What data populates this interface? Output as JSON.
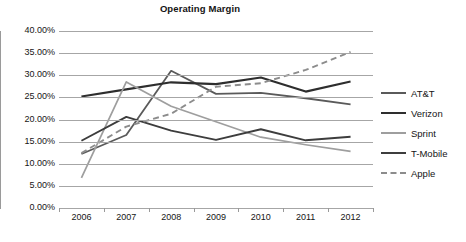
{
  "chart_data": {
    "type": "line",
    "title": "Operating Margin",
    "xlabel": "",
    "ylabel": "",
    "categories": [
      "2006",
      "2007",
      "2008",
      "2009",
      "2010",
      "2011",
      "2012"
    ],
    "x": [
      2006,
      2007,
      2008,
      2009,
      2010,
      2011,
      2012
    ],
    "ylim": [
      0,
      40
    ],
    "ytick_values": [
      0,
      5,
      10,
      15,
      20,
      25,
      30,
      35,
      40
    ],
    "ytick_labels": [
      "0.00%",
      "5.00%",
      "10.00%",
      "15.00%",
      "20.00%",
      "25.00%",
      "30.00%",
      "35.00%",
      "40.00%"
    ],
    "grid": true,
    "legend_position": "right",
    "series": [
      {
        "name": "AT&T",
        "values": [
          12.2,
          16.5,
          31.0,
          25.8,
          26.0,
          24.8,
          23.4
        ],
        "color": "#5a5a5a",
        "style": "solid",
        "width": 1.8
      },
      {
        "name": "Verizon",
        "values": [
          25.2,
          26.8,
          28.4,
          28.0,
          29.5,
          26.3,
          28.6
        ],
        "color": "#2e2e2e",
        "style": "solid",
        "width": 2.1
      },
      {
        "name": "Sprint",
        "values": [
          6.8,
          28.5,
          23.0,
          19.5,
          16.0,
          14.3,
          12.8
        ],
        "color": "#9e9e9e",
        "style": "solid",
        "width": 1.7
      },
      {
        "name": "T-Mobile",
        "values": [
          15.2,
          20.6,
          17.5,
          15.4,
          17.8,
          15.3,
          16.1
        ],
        "color": "#3d3d3d",
        "style": "solid",
        "width": 1.9
      },
      {
        "name": "Apple",
        "values": [
          12.4,
          18.4,
          21.3,
          27.4,
          28.2,
          31.2,
          35.3
        ],
        "color": "#8c8c8c",
        "style": "dashed",
        "width": 1.9
      }
    ],
    "colors": {
      "gridline": "#a6a6a6",
      "axis": "#9a9a9a",
      "text": "#141414",
      "background": "#ffffff"
    }
  }
}
